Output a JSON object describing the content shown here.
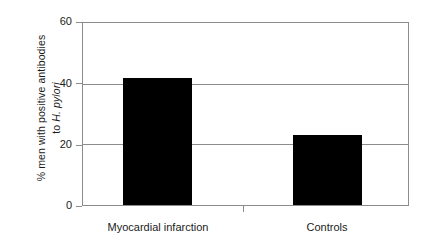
{
  "chart_data": {
    "type": "bar",
    "title": "",
    "subtitle": "",
    "xlabel": "",
    "ylabel_line1": "% men with positive antibodies",
    "ylabel_line2_prefix": "to ",
    "ylabel_line2_italic": "H. pylori",
    "categories": [
      "Myocardial infarction",
      "Controls"
    ],
    "values": [
      42,
      23
    ],
    "yticks": [
      0,
      20,
      40,
      60
    ],
    "ytick_labels": [
      "0",
      "20",
      "40",
      "60"
    ],
    "ylim": [
      0,
      60
    ],
    "grid": "horizontal",
    "legend": "none",
    "bar_color": "#000000",
    "axis_color": "#8c8c8c",
    "background": "#ffffff"
  },
  "axis": {
    "ytick_0": "0",
    "ytick_20": "20",
    "ytick_40": "40",
    "ytick_60": "60"
  },
  "categories": {
    "cat_0": "Myocardial infarction",
    "cat_1": "Controls"
  }
}
